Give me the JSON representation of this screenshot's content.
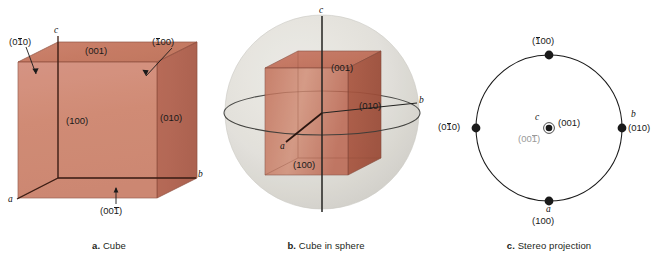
{
  "figure": {
    "background": "#ffffff",
    "cube_color": "#c8705a",
    "sphere_color": "#d8d8d4",
    "marker_color": "#1a1a1a",
    "gray_label_color": "#9a9a9a"
  },
  "panels": [
    {
      "id": "a",
      "caption_letter": "a.",
      "caption_text": "Cube",
      "axes": [
        "a",
        "b",
        "c"
      ],
      "face_labels": [
        {
          "name": "face-001-top",
          "pre": "(0",
          "bar": "",
          "post": "01)"
        },
        {
          "name": "face-100-front",
          "pre": "(1",
          "bar": "",
          "post": "00)"
        },
        {
          "name": "face-010-right",
          "pre": "(0",
          "bar": "",
          "post": "10)"
        },
        {
          "name": "face-0bar10-left",
          "pre": "(0",
          "bar": "1",
          "post": "0)"
        },
        {
          "name": "face-bar100-back",
          "pre": "(",
          "bar": "1",
          "post": "00)"
        },
        {
          "name": "face-001bar-bottom",
          "pre": "(00",
          "bar": "1",
          "post": ")"
        }
      ],
      "label_text": {
        "top": "(001)",
        "front": "(100)",
        "right": "(010)",
        "left": "(0̅1̅0)",
        "back": "(̅1̅00)",
        "bottom": "(00̅1̅)"
      }
    },
    {
      "id": "b",
      "caption_letter": "b.",
      "caption_text": "Cube in sphere",
      "axes": [
        "a",
        "b",
        "c"
      ],
      "face_labels": [
        {
          "name": "face-001-top",
          "pre": "(0",
          "bar": "",
          "post": "01)"
        },
        {
          "name": "face-010-right",
          "pre": "(0",
          "bar": "",
          "post": "10)"
        },
        {
          "name": "face-100-front",
          "pre": "(1",
          "bar": "",
          "post": "00)"
        }
      ],
      "label_text": {
        "top": "(001)",
        "right": "(010)",
        "front": "(100)"
      }
    },
    {
      "id": "c",
      "caption_letter": "c.",
      "caption_text": "Stereo projection",
      "points": [
        {
          "name": "pole-bar100-top",
          "axis": "",
          "index_pre": "(",
          "index_bar": "1",
          "index_post": "00)",
          "position": "top"
        },
        {
          "name": "pole-010-right",
          "axis": "b",
          "index_pre": "(0",
          "index_bar": "",
          "index_post": "10)",
          "position": "right"
        },
        {
          "name": "pole-100-bottom",
          "axis": "a",
          "index_pre": "(1",
          "index_bar": "",
          "index_post": "00)",
          "position": "bottom"
        },
        {
          "name": "pole-0bar10-left",
          "axis": "",
          "index_pre": "(0",
          "index_bar": "1",
          "index_post": "0)",
          "position": "left"
        },
        {
          "name": "pole-001-center",
          "axis": "c",
          "index_pre": "(0",
          "index_bar": "",
          "index_post": "01)",
          "position": "center"
        },
        {
          "name": "pole-001bar-center",
          "axis": "",
          "index_pre": "(00",
          "index_bar": "1",
          "index_post": ")",
          "position": "center-below",
          "gray": true
        }
      ],
      "label_text": {
        "top": "(̅1̅00)",
        "right_axis": "b",
        "right": "(010)",
        "bottom_axis": "a",
        "bottom": "(100)",
        "left": "(0̅1̅0)",
        "center_axis": "c",
        "center": "(001)",
        "center_below": "(00̅1̅)"
      }
    }
  ]
}
